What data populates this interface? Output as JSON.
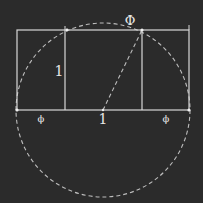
{
  "diagram": {
    "colors": {
      "background": "#2b2b2b",
      "line": "#d8d8d8",
      "dashed": "#bdbdbd",
      "text": "#e8e8e8"
    },
    "labels": {
      "top_phi": "Φ",
      "left_side_one": "1",
      "bottom_left_phi": "ϕ",
      "bottom_middle_one": "1",
      "bottom_right_phi": "ϕ"
    },
    "geometry": {
      "outer_rect": {
        "x1": 17,
        "y1": 30,
        "x2": 189,
        "y2": 110
      },
      "square": {
        "x1": 65,
        "y1": 30,
        "x2": 142,
        "y2": 110
      },
      "circle": {
        "cx": 103,
        "cy": 110,
        "r": 87
      },
      "diagonal": {
        "x1": 103,
        "y1": 110,
        "x2": 142,
        "y2": 30
      }
    }
  }
}
